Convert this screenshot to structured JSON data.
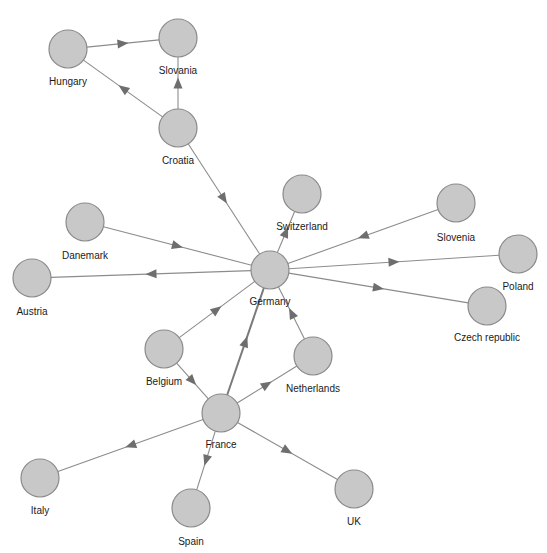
{
  "diagram": {
    "type": "directed-network",
    "node_radius": 19,
    "colors": {
      "node_fill": "#c8c8c8",
      "node_stroke": "#8a8a8a",
      "edge": "#8c8c8c",
      "arrow": "#6e6e6e",
      "label": "#1a1a1a",
      "background": "#ffffff"
    },
    "nodes": [
      {
        "id": "hungary",
        "label": "Hungary",
        "x": 68,
        "y": 49,
        "lx": 68,
        "ly": 85
      },
      {
        "id": "slovania",
        "label": "Slovania",
        "x": 178,
        "y": 38,
        "lx": 178,
        "ly": 74
      },
      {
        "id": "croatia",
        "label": "Croatia",
        "x": 178,
        "y": 128,
        "lx": 178,
        "ly": 164
      },
      {
        "id": "switzerland",
        "label": "Switzerland",
        "x": 302,
        "y": 194,
        "lx": 302,
        "ly": 230
      },
      {
        "id": "germany",
        "label": "Germany",
        "x": 270,
        "y": 270,
        "lx": 270,
        "ly": 305
      },
      {
        "id": "danemark",
        "label": "Danemark",
        "x": 85,
        "y": 222,
        "lx": 85,
        "ly": 259
      },
      {
        "id": "austria",
        "label": "Austria",
        "x": 32,
        "y": 278,
        "lx": 32,
        "ly": 315
      },
      {
        "id": "slovenia",
        "label": "Slovenia",
        "x": 456,
        "y": 203,
        "lx": 456,
        "ly": 241
      },
      {
        "id": "poland",
        "label": "Poland",
        "x": 518,
        "y": 254,
        "lx": 518,
        "ly": 290
      },
      {
        "id": "czech",
        "label": "Czech republic",
        "x": 487,
        "y": 306,
        "lx": 487,
        "ly": 341
      },
      {
        "id": "belgium",
        "label": "Belgium",
        "x": 164,
        "y": 349,
        "lx": 164,
        "ly": 385
      },
      {
        "id": "netherlands",
        "label": "Netherlands",
        "x": 313,
        "y": 356,
        "lx": 313,
        "ly": 392
      },
      {
        "id": "france",
        "label": "France",
        "x": 221,
        "y": 413,
        "lx": 221,
        "ly": 448
      },
      {
        "id": "italy",
        "label": "Italy",
        "x": 40,
        "y": 478,
        "lx": 40,
        "ly": 514
      },
      {
        "id": "spain",
        "label": "Spain",
        "x": 191,
        "y": 508,
        "lx": 191,
        "ly": 545
      },
      {
        "id": "uk",
        "label": "UK",
        "x": 354,
        "y": 489,
        "lx": 354,
        "ly": 525
      }
    ],
    "edges": [
      {
        "from": "hungary",
        "to": "slovania"
      },
      {
        "from": "croatia",
        "to": "hungary"
      },
      {
        "from": "croatia",
        "to": "slovania"
      },
      {
        "from": "croatia",
        "to": "germany"
      },
      {
        "from": "germany",
        "to": "switzerland"
      },
      {
        "from": "danemark",
        "to": "germany"
      },
      {
        "from": "germany",
        "to": "austria"
      },
      {
        "from": "slovenia",
        "to": "germany"
      },
      {
        "from": "germany",
        "to": "poland"
      },
      {
        "from": "germany",
        "to": "czech"
      },
      {
        "from": "belgium",
        "to": "germany"
      },
      {
        "from": "netherlands",
        "to": "germany"
      },
      {
        "from": "belgium",
        "to": "france"
      },
      {
        "from": "france",
        "to": "germany",
        "thick": true
      },
      {
        "from": "france",
        "to": "netherlands"
      },
      {
        "from": "france",
        "to": "italy"
      },
      {
        "from": "france",
        "to": "spain"
      },
      {
        "from": "france",
        "to": "uk"
      }
    ]
  }
}
